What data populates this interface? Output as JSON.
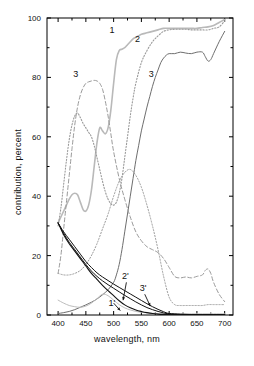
{
  "figure": {
    "background": "#ffffff",
    "frame_color": "#000000"
  },
  "axes": {
    "x_title": "wavelength, nm",
    "y_title": "contribution, percent",
    "x_ticks": [
      "400",
      "450",
      "500",
      "550",
      "600",
      "650",
      "700"
    ],
    "y_ticks": [
      "0",
      "20",
      "40",
      "60",
      "80",
      "100"
    ]
  },
  "labels": {
    "c1": "1",
    "c2": "2",
    "c3": "3",
    "c1p": "1'",
    "c2p": "2'",
    "c3p": "3'"
  },
  "chart_data": {
    "type": "line",
    "title": "",
    "xlabel": "wavelength, nm",
    "ylabel": "contribution, percent",
    "xlim": [
      380,
      715
    ],
    "ylim": [
      0,
      100
    ],
    "grid": false,
    "legend": "inline-curve-labels",
    "x_ticks": [
      400,
      450,
      500,
      550,
      600,
      650,
      700
    ],
    "y_ticks": [
      0,
      20,
      40,
      60,
      80,
      100
    ],
    "x_minor_ticks": [
      425,
      475,
      525,
      575,
      625,
      675
    ],
    "y_minor_ticks": [
      10,
      30,
      50,
      70,
      90
    ],
    "series": [
      {
        "name": "1",
        "label": "1",
        "style": "solid",
        "color": "#b9b9b9",
        "width": 1.6,
        "label_xy": [
          497,
          95
        ],
        "x": [
          400,
          405,
          410,
          415,
          420,
          425,
          430,
          435,
          440,
          445,
          450,
          455,
          460,
          465,
          470,
          475,
          480,
          485,
          490,
          495,
          500,
          505,
          510,
          515,
          520,
          525,
          530,
          535,
          540,
          545,
          550,
          560,
          570,
          580,
          590,
          600,
          610,
          620,
          630,
          640,
          650,
          660,
          670,
          680,
          690,
          700
        ],
        "y": [
          31,
          33,
          35,
          37,
          39,
          40.5,
          41,
          40.5,
          38,
          35.5,
          35,
          37,
          42,
          50,
          58,
          63,
          62,
          61,
          63,
          69,
          78,
          86,
          89,
          89.5,
          90,
          91,
          92,
          93,
          93.5,
          94,
          94.5,
          95,
          95.5,
          96,
          96.5,
          96.5,
          96.5,
          96.5,
          96.5,
          96.5,
          96.5,
          96.8,
          97,
          97.5,
          98.5,
          99.5
        ]
      },
      {
        "name": "2",
        "label": "2",
        "style": "dotted",
        "color": "#9a9a9a",
        "width": 1.1,
        "label_xy": [
          543,
          92
        ],
        "x": [
          400,
          405,
          410,
          415,
          420,
          425,
          430,
          435,
          440,
          445,
          450,
          455,
          460,
          465,
          470,
          475,
          480,
          485,
          490,
          495,
          500,
          505,
          510,
          515,
          520,
          525,
          530,
          535,
          540,
          550,
          560,
          570,
          580,
          590,
          600,
          610,
          620,
          630,
          640,
          650,
          660,
          670,
          680,
          690,
          700
        ],
        "y": [
          30,
          36,
          44,
          52,
          59,
          64,
          67,
          68,
          66.5,
          64.5,
          63,
          61.5,
          60,
          57,
          53,
          49,
          45,
          41.5,
          39,
          37.5,
          37,
          38,
          41,
          46,
          53,
          60,
          67,
          73,
          78,
          85,
          89,
          92,
          94,
          95.5,
          96,
          96.2,
          96.2,
          96.2,
          96,
          96,
          96,
          96,
          96.5,
          97,
          99
        ]
      },
      {
        "name": "3",
        "label": "3",
        "style": "solid",
        "color": "#6e6e6e",
        "width": 1.0,
        "label_xy": [
          568,
          80
        ],
        "x": [
          400,
          410,
          420,
          430,
          440,
          450,
          460,
          470,
          480,
          490,
          500,
          505,
          510,
          515,
          520,
          525,
          530,
          535,
          540,
          545,
          550,
          555,
          560,
          565,
          570,
          575,
          580,
          585,
          590,
          595,
          600,
          610,
          620,
          630,
          640,
          650,
          660,
          665,
          670,
          675,
          680,
          690,
          700
        ],
        "y": [
          0.5,
          0.8,
          1.2,
          1.8,
          2.6,
          3.4,
          4.3,
          5.4,
          6.8,
          8.5,
          11,
          13.5,
          17,
          22,
          28,
          34,
          40,
          46,
          52,
          57,
          62,
          66,
          70,
          73.5,
          77,
          80,
          82.5,
          85,
          86.5,
          87.5,
          88,
          88,
          88.5,
          88.2,
          88,
          88.5,
          88.5,
          87,
          85.5,
          86,
          88,
          92,
          95.5
        ]
      },
      {
        "name": "3-dashed-rise",
        "label": "3",
        "style": "dashed",
        "color": "#9a9a9a",
        "width": 1.0,
        "label_xy": [
          432,
          80
        ],
        "x": [
          400,
          405,
          410,
          415,
          420,
          425,
          430,
          435,
          440,
          445,
          450,
          455,
          460,
          465,
          470,
          475,
          480,
          485,
          490,
          495,
          500,
          510,
          520,
          530,
          540,
          550,
          560,
          570,
          580,
          590,
          600,
          610,
          620,
          630,
          640,
          650,
          660,
          665,
          670,
          675,
          680,
          690,
          700
        ],
        "y": [
          14,
          20,
          29,
          38,
          47,
          56,
          64,
          70,
          74,
          76.5,
          78,
          78.5,
          78.8,
          79,
          78.8,
          78,
          76,
          72,
          67,
          61,
          55,
          46,
          39,
          33,
          28,
          25,
          23,
          22,
          21,
          19,
          16,
          13,
          12.5,
          12.8,
          12.5,
          13,
          13.5,
          15,
          15.5,
          14,
          11,
          7,
          4.5
        ]
      },
      {
        "name": "2-low-dotted",
        "label": "2",
        "style": "dotted",
        "color": "#9a9a9a",
        "width": 1.0,
        "label_xy": [
          0,
          0
        ],
        "x": [
          400,
          410,
          420,
          430,
          440,
          450,
          460,
          470,
          480,
          490,
          500,
          510,
          520,
          530,
          540,
          550,
          560,
          570,
          580,
          590,
          600,
          610,
          620,
          630,
          640,
          650,
          660,
          670,
          680,
          690,
          700
        ],
        "y": [
          14,
          13.5,
          13.5,
          14,
          15,
          17,
          20,
          24,
          29,
          34,
          40,
          45,
          48,
          49,
          47,
          43,
          37,
          30,
          22,
          13,
          6,
          3.5,
          3.2,
          3.2,
          3.2,
          3.2,
          3.2,
          3.5,
          3.5,
          3.5,
          3.5
        ]
      },
      {
        "name": "1-low-solid",
        "label": "1",
        "style": "solid",
        "color": "#bdbdbd",
        "width": 1.0,
        "label_xy": [
          0,
          0
        ],
        "x": [
          400,
          410,
          420,
          430,
          440,
          450,
          460,
          470,
          480,
          490,
          500,
          510,
          520,
          530,
          540,
          550,
          560,
          570,
          580,
          590,
          600,
          620,
          640,
          660,
          680,
          700
        ],
        "y": [
          5,
          4,
          3.2,
          2.8,
          2.6,
          3.0,
          4.0,
          5.5,
          7.0,
          6.5,
          5.0,
          3.5,
          2.4,
          1.7,
          1.2,
          0.9,
          0.7,
          0.6,
          0.5,
          0.4,
          0.4,
          0.4,
          0.4,
          0.4,
          0.4,
          0.4
        ]
      },
      {
        "name": "1'",
        "label": "1'",
        "style": "solid",
        "color": "#111111",
        "width": 1.1,
        "label_xy": [
          497,
          3
        ],
        "x": [
          400,
          410,
          420,
          430,
          440,
          450,
          460,
          470,
          480,
          490,
          500,
          510,
          520,
          530,
          540,
          550,
          560,
          570,
          580,
          590,
          600,
          620,
          640,
          660,
          680,
          700
        ],
        "y": [
          31,
          27,
          24,
          21.5,
          19,
          16.5,
          14,
          12,
          10,
          8.2,
          6.5,
          4.8,
          3.4,
          2.4,
          1.7,
          1.2,
          0.8,
          0.5,
          0.3,
          0.2,
          0.15,
          0.1,
          0.1,
          0.1,
          0.1,
          0.1
        ]
      },
      {
        "name": "2'",
        "label": "2'",
        "style": "solid",
        "color": "#111111",
        "width": 1.0,
        "label_xy": [
          521,
          12
        ],
        "x": [
          400,
          410,
          420,
          430,
          440,
          450,
          460,
          470,
          480,
          490,
          500,
          510,
          520,
          530,
          540,
          550,
          560,
          570,
          580,
          590,
          600,
          620,
          640,
          660,
          680,
          700
        ],
        "y": [
          31,
          27.5,
          24.5,
          22,
          19.5,
          17,
          14.8,
          13,
          11.5,
          10.2,
          9.0,
          7.8,
          6.6,
          5.5,
          4.4,
          3.4,
          2.5,
          1.8,
          1.2,
          0.7,
          0.4,
          0.2,
          0.15,
          0.1,
          0.1,
          0.1
        ]
      },
      {
        "name": "3'",
        "label": "3'",
        "style": "solid",
        "color": "#111111",
        "width": 1.0,
        "label_xy": [
          553,
          8
        ],
        "x": [
          400,
          410,
          420,
          430,
          440,
          450,
          460,
          470,
          480,
          490,
          500,
          510,
          520,
          530,
          540,
          550,
          560,
          570,
          580,
          590,
          600,
          620,
          640,
          660,
          680,
          700
        ],
        "y": [
          31,
          28,
          25.5,
          23,
          20.5,
          18,
          16,
          14.2,
          12.8,
          11.6,
          10.4,
          9.3,
          8.2,
          7.1,
          6.0,
          4.9,
          3.8,
          2.8,
          1.9,
          1.1,
          0.5,
          0.25,
          0.15,
          0.1,
          0.1,
          0.1
        ]
      }
    ],
    "annotations": [
      {
        "label": "1'",
        "from": [
          500,
          4
        ],
        "to": [
          512,
          1.5
        ]
      },
      {
        "label": "2'",
        "from": [
          523,
          11
        ],
        "to": [
          517,
          5
        ]
      },
      {
        "label": "3'",
        "from": [
          556,
          7
        ],
        "to": [
          566,
          3
        ]
      }
    ]
  }
}
